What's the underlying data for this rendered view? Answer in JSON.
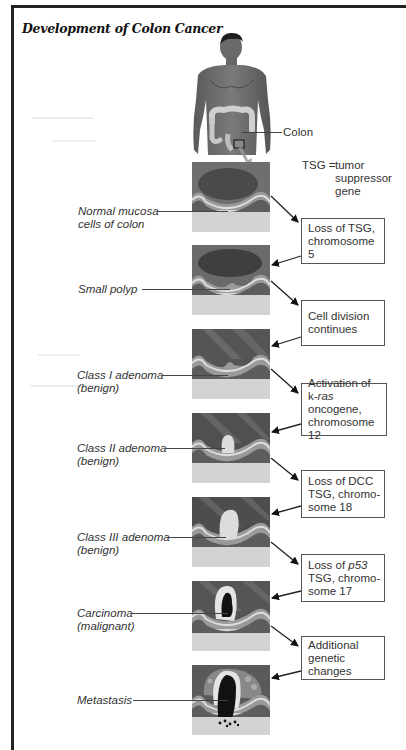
{
  "title": "Development of Colon Cancer",
  "figure": {
    "colon_label": "Colon",
    "legend": {
      "abbr": "TSG",
      "eq": "=",
      "line1": "tumor",
      "line2": "suppressor",
      "line3": "gene"
    }
  },
  "stages": [
    {
      "line1": "Normal mucosa",
      "line2": "cells of colon"
    },
    {
      "line1": "Small polyp",
      "line2": ""
    },
    {
      "line1": "Class I adenoma",
      "line2": "(benign)"
    },
    {
      "line1": "Class II adenoma",
      "line2": "(benign)"
    },
    {
      "line1": "Class III adenoma",
      "line2": "(benign)"
    },
    {
      "line1": "Carcinoma",
      "line2": "(malignant)"
    },
    {
      "line1": "Metastasis",
      "line2": ""
    }
  ],
  "transitions": [
    {
      "lines": [
        "Loss of TSG,",
        "chromosome 5"
      ]
    },
    {
      "lines": [
        "Cell division",
        "continues"
      ]
    },
    {
      "lines": [
        "Activation of",
        "k-ras oncogene,",
        "chromosome 12"
      ],
      "italic_word": "ras",
      "prefix": "k-",
      "suffix": " oncogene,"
    },
    {
      "lines": [
        "Loss of DCC",
        "TSG, chromo-",
        "some 18"
      ]
    },
    {
      "lines": [
        "Loss of p53",
        "TSG, chromo-",
        "some 17"
      ],
      "italic_word": "p53",
      "prefix": "Loss of "
    },
    {
      "lines": [
        "Additional",
        "genetic",
        "changes"
      ]
    }
  ]
}
